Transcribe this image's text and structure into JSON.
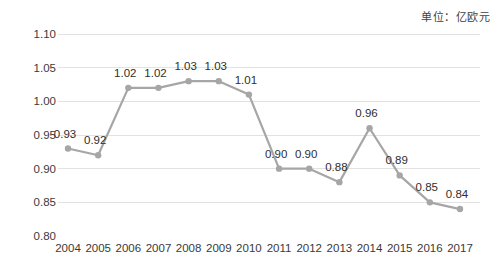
{
  "unit_note": "单位：亿欧元",
  "chart_data": {
    "type": "line",
    "title": "",
    "subtitle": "",
    "xlabel": "",
    "ylabel": "",
    "unit": "单位：亿欧元",
    "grid": true,
    "legend": "none",
    "categories": [
      "2004",
      "2005",
      "2006",
      "2007",
      "2008",
      "2009",
      "2010",
      "2011",
      "2012",
      "2013",
      "2014",
      "2015",
      "2016",
      "2017"
    ],
    "values": [
      0.93,
      0.92,
      1.02,
      1.02,
      1.03,
      1.03,
      1.01,
      0.9,
      0.9,
      0.88,
      0.96,
      0.89,
      0.85,
      0.84
    ],
    "point_labels": [
      "0.93",
      "0.92",
      "1.02",
      "1.02",
      "1.03",
      "1.03",
      "1.01",
      "0.90",
      "0.90",
      "0.88",
      "0.96",
      "0.89",
      "0.85",
      "0.84"
    ],
    "ylim": [
      0.8,
      1.1
    ],
    "ytick_labels": [
      "1.10",
      "1.05",
      "1.00",
      "0.95",
      "0.90",
      "0.85",
      "0.80"
    ],
    "ytick_values": [
      1.1,
      1.05,
      1.0,
      0.95,
      0.9,
      0.85,
      0.8
    ],
    "series": [
      {
        "name": "value",
        "values": [
          0.93,
          0.92,
          1.02,
          1.02,
          1.03,
          1.03,
          1.01,
          0.9,
          0.9,
          0.88,
          0.96,
          0.89,
          0.85,
          0.84
        ]
      }
    ],
    "colors": {
      "line": "#a6a6a6",
      "marker": "#a6a6a6",
      "grid": "#e2e2e2",
      "text": "#3a3a3a",
      "background": "#ffffff"
    }
  }
}
